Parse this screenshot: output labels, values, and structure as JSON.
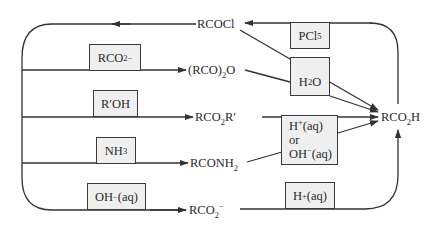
{
  "diagram": {
    "colors": {
      "line": "#333333",
      "box_fill": "#efefef",
      "box_border": "#3a3a3a",
      "text": "#2a2a2a"
    },
    "compounds": {
      "acid_chloride": {
        "main": "RCOCl"
      },
      "anhydride": {
        "pre": "(RCO)",
        "sub": "2",
        "post": "O"
      },
      "ester": {
        "pre": "RCO",
        "sub": "2",
        "post": "R′"
      },
      "amide": {
        "pre": "RCONH",
        "sub": "2"
      },
      "carboxylate": {
        "pre": "RCO",
        "sub": "2",
        "sup": "−"
      },
      "carboxylic_acid": {
        "pre": "RCO",
        "sub": "2",
        "post": "H"
      }
    },
    "reagents": {
      "pcl5": {
        "pre": "PCl",
        "sub": "5"
      },
      "h2o": {
        "pre": "H",
        "sub": "2",
        "post": "O"
      },
      "carboxylate": {
        "pre": "RCO",
        "sub": "2",
        "sup": "−"
      },
      "alcohol": {
        "main": "R′OH"
      },
      "ammonia": {
        "pre": "NH",
        "sub": "3"
      },
      "hydrolysis": {
        "line1_pre": "H",
        "line1_sup": "+",
        "line1_post": "(aq)",
        "line2": "or",
        "line3_pre": "OH",
        "line3_sup": "−",
        "line3_post": "(aq)"
      },
      "hydroxide": {
        "pre": "OH",
        "sup": "−",
        "post": "(aq)"
      },
      "acid": {
        "pre": "H",
        "sup": "+",
        "post": "(aq)"
      }
    }
  }
}
